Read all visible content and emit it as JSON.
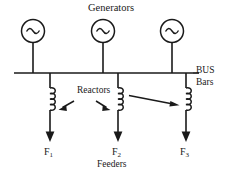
{
  "diagram": {
    "title": "Generators",
    "labels": {
      "generators": "Generators",
      "reactors": "Reactors",
      "feeders": "Feeders",
      "bus_line1": "BUS",
      "bus_line2": "Bars"
    },
    "generators": [
      {
        "id": "G1",
        "symbol": "~",
        "x": 33
      },
      {
        "id": "G2",
        "symbol": "~",
        "x": 103
      },
      {
        "id": "G3",
        "symbol": "~",
        "x": 172
      }
    ],
    "feeders": [
      {
        "name": "F",
        "index": "1",
        "x": 50
      },
      {
        "name": "F",
        "index": "2",
        "x": 118
      },
      {
        "name": "F",
        "index": "3",
        "x": 186
      }
    ],
    "reactor_count": 3,
    "colors": {
      "line": "#1a1a1a",
      "background": "#ffffff",
      "text": "#1a1a1a"
    }
  }
}
